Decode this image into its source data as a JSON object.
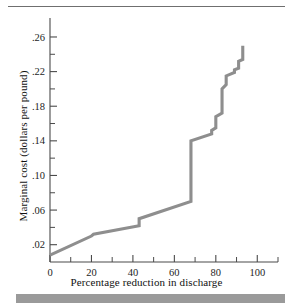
{
  "figure": {
    "name": "marginal-abatement-cost-figure",
    "top_rule": true,
    "bottom_bar": true,
    "line_color": "#8e8e8e",
    "axis_color": "#4a4a4a",
    "background": "#ffffff"
  },
  "chart_data": {
    "type": "line",
    "title": "",
    "xlabel": "Percentage reduction in discharge",
    "ylabel": "Marginal cost (dollars per pound)",
    "xlim": [
      0,
      110
    ],
    "ylim": [
      0,
      0.275
    ],
    "grid": false,
    "legend": null,
    "xticks": [
      0,
      20,
      40,
      60,
      80,
      100
    ],
    "xticklabels": [
      "0",
      "20",
      "40",
      "60",
      "80",
      "100"
    ],
    "xticks_minor": [
      10,
      30,
      50,
      70,
      90,
      110
    ],
    "yticks": [
      0.02,
      0.06,
      0.1,
      0.14,
      0.18,
      0.22,
      0.26
    ],
    "yticklabels": [
      ".02",
      ".06",
      ".10",
      ".14",
      ".18",
      ".22",
      ".26"
    ],
    "yticks_minor": [
      0.04,
      0.08,
      0.12,
      0.16,
      0.2,
      0.24
    ],
    "series": [
      {
        "name": "Marginal cost of discharge reduction",
        "step_like": true,
        "x": [
          0,
          20,
          21,
          43,
          43,
          68,
          68,
          78,
          78,
          80,
          80,
          83,
          83,
          85,
          85,
          89,
          89,
          91,
          91,
          93,
          93
        ],
        "y": [
          0.008,
          0.03,
          0.032,
          0.042,
          0.05,
          0.07,
          0.14,
          0.148,
          0.152,
          0.155,
          0.168,
          0.172,
          0.2,
          0.205,
          0.215,
          0.219,
          0.222,
          0.224,
          0.232,
          0.234,
          0.25
        ]
      }
    ]
  },
  "labels": {
    "y_axis": "Marginal cost (dollars per pound)",
    "x_axis": "Percentage reduction in discharge"
  }
}
